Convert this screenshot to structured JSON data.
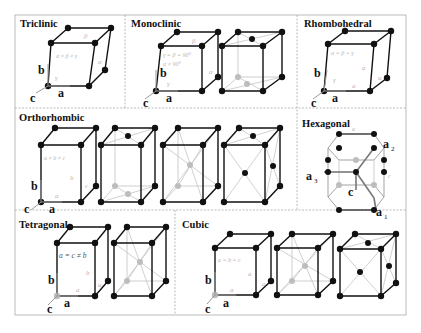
{
  "figure": {
    "panels": [
      {
        "id": "triclinic",
        "title": "Triclinic",
        "relation": "α ≠ β ≠ γ",
        "angles": [
          "α",
          "β",
          "γ"
        ],
        "axes": [
          "a",
          "b",
          "c"
        ]
      },
      {
        "id": "monoclinic",
        "title": "Monoclinic",
        "relation": "γ = β = 90°",
        "relation2": "α ≠ 90°",
        "angles": [
          "α",
          "β",
          "γ"
        ],
        "axes": [
          "a",
          "b",
          "c"
        ],
        "lattices": [
          "primitive",
          "base-centered"
        ]
      },
      {
        "id": "rhombohedral",
        "title": "Rhombohedral",
        "relation": "α = β = γ",
        "edges": [
          "a",
          "a",
          "a"
        ],
        "angles": [
          "α",
          "γ"
        ],
        "axes": [
          "a",
          "b",
          "c"
        ]
      },
      {
        "id": "orthorhombic",
        "title": "Orthorhombic",
        "relation": "a ≠ b ≠ c",
        "edges": [
          "a",
          "b",
          "c"
        ],
        "axes": [
          "a",
          "b",
          "c"
        ],
        "lattices": [
          "primitive",
          "base-centered",
          "body-centered",
          "face-centered"
        ]
      },
      {
        "id": "hexagonal",
        "title": "Hexagonal",
        "edges": [
          "a",
          "c"
        ],
        "axes": [
          "a1",
          "a2",
          "a3",
          "c"
        ]
      },
      {
        "id": "tetragonal",
        "title": "Tetragonal",
        "relation": "a = c ≠ b",
        "edges": [
          "a",
          "b",
          "a"
        ],
        "axes": [
          "a",
          "b",
          "c"
        ],
        "lattices": [
          "primitive",
          "body-centered"
        ]
      },
      {
        "id": "cubic",
        "title": "Cubic",
        "relation": "a = b = c",
        "edges": [
          "a",
          "a",
          "a"
        ],
        "axes": [
          "a",
          "b",
          "c"
        ],
        "lattices": [
          "primitive",
          "body-centered",
          "face-centered"
        ]
      }
    ],
    "labels": {
      "a": "a",
      "b": "b",
      "c": "c",
      "alpha": "α",
      "beta": "β",
      "gamma": "γ",
      "edge_a": "a",
      "edge_b": "b",
      "edge_c": "c",
      "a1_base": "a",
      "a1_sub": "1",
      "a2_base": "a",
      "a2_sub": "2",
      "a3_base": "a",
      "a3_sub": "3"
    },
    "colors": {
      "edge": "#111111",
      "hidden": "#c8c8c8",
      "atom": "#111111",
      "atom_hidden": "#bdbdbd",
      "text_light": "#b5b5b5",
      "border": "#aaaaaa"
    }
  }
}
